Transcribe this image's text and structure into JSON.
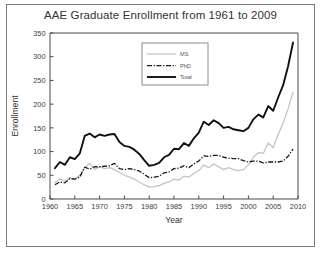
{
  "figure": {
    "title": "AAE Graduate Enrollment from 1961 to 2009",
    "frame_color": "#7a7a7a",
    "background": "#ffffff"
  },
  "legend": {
    "position": "upper-center",
    "entries": [
      {
        "label": "MS",
        "style": "solid",
        "color": "#c3c3c3"
      },
      {
        "label": "PhD",
        "style": "dash-dot",
        "color": "#1a1a1a"
      },
      {
        "label": "Total",
        "style": "solid",
        "color": "#111111"
      }
    ]
  },
  "chart_data": {
    "type": "line",
    "title": "AAE Graduate Enrollment from 1961 to 2009",
    "xlabel": "Year",
    "ylabel": "Enrollment",
    "xlim": [
      1960,
      2010
    ],
    "ylim": [
      0,
      350
    ],
    "xticks": [
      1960,
      1965,
      1970,
      1975,
      1980,
      1985,
      1990,
      1995,
      2000,
      2005,
      2010
    ],
    "yticks": [
      0,
      50,
      100,
      150,
      200,
      250,
      300,
      350
    ],
    "grid": false,
    "legend_position": "upper center",
    "x": [
      1961,
      1962,
      1963,
      1964,
      1965,
      1966,
      1967,
      1968,
      1969,
      1970,
      1971,
      1972,
      1973,
      1974,
      1975,
      1976,
      1977,
      1978,
      1979,
      1980,
      1981,
      1982,
      1983,
      1984,
      1985,
      1986,
      1987,
      1988,
      1989,
      1990,
      1991,
      1992,
      1993,
      1994,
      1995,
      1996,
      1997,
      1998,
      1999,
      2000,
      2001,
      2002,
      2003,
      2004,
      2005,
      2006,
      2007,
      2008,
      2009
    ],
    "series": [
      {
        "name": "Total",
        "color": "#111111",
        "style": "solid",
        "values": [
          65,
          78,
          72,
          88,
          84,
          96,
          133,
          138,
          130,
          136,
          133,
          136,
          137,
          120,
          112,
          110,
          104,
          95,
          82,
          70,
          72,
          76,
          88,
          93,
          106,
          105,
          118,
          112,
          128,
          140,
          163,
          156,
          166,
          160,
          150,
          152,
          147,
          145,
          143,
          150,
          168,
          178,
          172,
          196,
          186,
          214,
          240,
          280,
          330
        ]
      },
      {
        "name": "MS",
        "color": "#c3c3c3",
        "style": "solid",
        "values": [
          35,
          42,
          38,
          45,
          42,
          50,
          66,
          75,
          62,
          68,
          64,
          66,
          62,
          56,
          50,
          46,
          42,
          36,
          30,
          25,
          26,
          28,
          33,
          36,
          42,
          40,
          48,
          46,
          54,
          60,
          72,
          66,
          74,
          68,
          62,
          66,
          62,
          60,
          62,
          72,
          88,
          98,
          96,
          118,
          108,
          136,
          160,
          190,
          225
        ]
      },
      {
        "name": "PhD",
        "color": "#1a1a1a",
        "style": "dash-dot",
        "values": [
          30,
          36,
          34,
          43,
          42,
          46,
          67,
          63,
          68,
          68,
          69,
          70,
          75,
          64,
          62,
          64,
          62,
          59,
          52,
          45,
          46,
          48,
          55,
          57,
          64,
          65,
          70,
          66,
          74,
          80,
          91,
          90,
          92,
          92,
          88,
          86,
          85,
          85,
          81,
          78,
          80,
          80,
          76,
          78,
          78,
          78,
          80,
          90,
          105
        ]
      }
    ]
  }
}
